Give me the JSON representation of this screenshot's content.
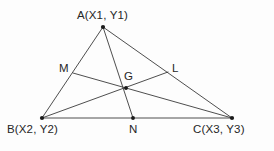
{
  "figure": {
    "background_color": "#fdfdfd",
    "stroke_color": "#3a3a3a",
    "text_color": "#262626",
    "point_color": "#1a1a1a",
    "stroke_width": 0.9,
    "width": 274,
    "height": 151
  },
  "labels": {
    "vertex_a": "A(X1, Y1)",
    "vertex_b": "B(X2, Y2)",
    "vertex_c": "C(X3, Y3)",
    "midpoint_m": "M",
    "midpoint_n": "N",
    "midpoint_l": "L",
    "centroid_g": "G"
  },
  "chart_data": {
    "type": "diagram",
    "points": [
      {
        "name": "A",
        "label": "A(X1, Y1)",
        "x": 103,
        "y": 27,
        "role": "vertex",
        "marked": true
      },
      {
        "name": "B",
        "label": "B(X2, Y2)",
        "x": 42,
        "y": 118,
        "role": "vertex",
        "marked": true
      },
      {
        "name": "C",
        "label": "C(X3, Y3)",
        "x": 232,
        "y": 118,
        "role": "vertex",
        "marked": true
      },
      {
        "name": "M",
        "label": "M",
        "x": 73,
        "y": 73,
        "role": "midpoint_of_AB",
        "marked": false
      },
      {
        "name": "N",
        "label": "N",
        "x": 133,
        "y": 118,
        "role": "midpoint_of_BC",
        "marked": true
      },
      {
        "name": "L",
        "label": "L",
        "x": 168,
        "y": 72,
        "role": "midpoint_of_AC",
        "marked": false
      },
      {
        "name": "G",
        "label": "G",
        "x": 126,
        "y": 88,
        "role": "centroid",
        "marked": true
      }
    ],
    "segments": [
      {
        "name": "side-AB",
        "from": "A",
        "to": "B",
        "kind": "side"
      },
      {
        "name": "side-BC",
        "from": "B",
        "to": "C",
        "kind": "side"
      },
      {
        "name": "side-AC",
        "from": "A",
        "to": "C",
        "kind": "side"
      },
      {
        "name": "median-AN",
        "from": "A",
        "to": "N",
        "kind": "median"
      },
      {
        "name": "median-BL",
        "from": "B",
        "to": "L",
        "kind": "median"
      },
      {
        "name": "median-CM",
        "from": "C",
        "to": "M",
        "kind": "median"
      }
    ]
  }
}
